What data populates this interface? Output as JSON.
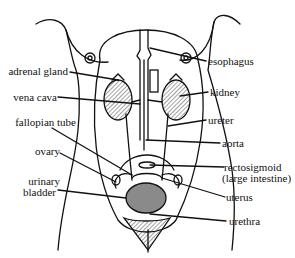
{
  "diagram": {
    "type": "anatomical line drawing",
    "labels_left": [
      {
        "id": "adrenal-gland",
        "text": "adrenal gland"
      },
      {
        "id": "vena-cava",
        "text": "vena cava"
      },
      {
        "id": "fallopian-tube",
        "text": "fallopian tube"
      },
      {
        "id": "ovary",
        "text": "ovary"
      },
      {
        "id": "urinary-bladder-1",
        "text": "urinary"
      },
      {
        "id": "urinary-bladder-2",
        "text": "bladder"
      }
    ],
    "labels_right": [
      {
        "id": "esophagus",
        "text": "esophagus"
      },
      {
        "id": "kidney",
        "text": "kidney"
      },
      {
        "id": "ureter",
        "text": "ureter"
      },
      {
        "id": "aorta",
        "text": "aorta"
      },
      {
        "id": "rectosigmoid-1",
        "text": "rectosigmoid"
      },
      {
        "id": "rectosigmoid-2",
        "text": "(large intestine)"
      },
      {
        "id": "uterus",
        "text": "uterus"
      },
      {
        "id": "urethra",
        "text": "urethra"
      }
    ],
    "colors": {
      "line": "#111111",
      "kidney_hatch": "#555555",
      "bladder_fill": "#8a8a8a",
      "background": "#ffffff"
    }
  }
}
